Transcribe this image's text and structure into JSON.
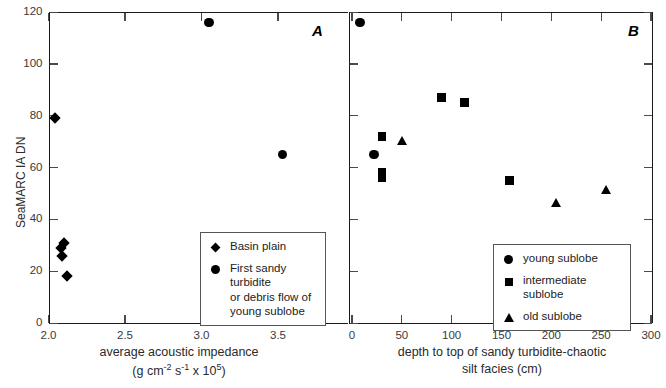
{
  "figure": {
    "y_axis_label": "SeaMARC IA DN",
    "panel_a_label": "A",
    "panel_b_label": "B"
  },
  "panel_a": {
    "xlabel_line1": "average acoustic impedance",
    "xlabel_line2_pre": "(g cm",
    "xlabel_line2_sup1": "-2",
    "xlabel_line2_mid": " s",
    "xlabel_line2_sup2": "-1",
    "xlabel_line2_post": " x 10",
    "xlabel_line2_sup3": "5",
    "xlabel_line2_end": ")",
    "x_ticks": [
      "2.0",
      "2.5",
      "3.0",
      "3.5"
    ],
    "y_ticks": [
      "0",
      "20",
      "40",
      "60",
      "80",
      "100",
      "120"
    ],
    "legend": [
      {
        "marker": "diamond",
        "label": "Basin plain"
      },
      {
        "marker": "circle",
        "label": "First sandy turbidite\nor debris flow of\nyoung sublobe"
      }
    ]
  },
  "panel_b": {
    "xlabel_line1": "depth to top of sandy turbidite-chaotic",
    "xlabel_line2": "silt facies (cm)",
    "x_ticks": [
      "0",
      "50",
      "100",
      "150",
      "200",
      "250",
      "300"
    ],
    "legend": [
      {
        "marker": "circle",
        "label": "young sublobe"
      },
      {
        "marker": "square",
        "label": "intermediate sublobe"
      },
      {
        "marker": "triangle",
        "label": "old sublobe"
      }
    ]
  },
  "chart_data": [
    {
      "type": "scatter",
      "panel": "A",
      "title": "",
      "xlabel": "average acoustic impedance (g cm-2 s-1 x 10^5)",
      "ylabel": "SeaMARC IA DN",
      "xlim": [
        1.95,
        3.75
      ],
      "ylim": [
        0,
        120
      ],
      "xticks": [
        2.0,
        2.5,
        3.0,
        3.5
      ],
      "yticks": [
        0,
        20,
        40,
        60,
        80,
        100,
        120
      ],
      "grid": false,
      "legend_position": "lower-right-inside",
      "series": [
        {
          "name": "Basin plain",
          "marker": "diamond",
          "color": "#000000",
          "points": [
            {
              "x": 2.04,
              "y": 79
            },
            {
              "x": 2.1,
              "y": 31
            },
            {
              "x": 2.08,
              "y": 29
            },
            {
              "x": 2.09,
              "y": 26
            },
            {
              "x": 2.12,
              "y": 18
            }
          ]
        },
        {
          "name": "First sandy turbidite or debris flow of young sublobe",
          "marker": "circle",
          "color": "#000000",
          "points": [
            {
              "x": 3.05,
              "y": 116
            },
            {
              "x": 3.53,
              "y": 65
            }
          ]
        }
      ]
    },
    {
      "type": "scatter",
      "panel": "B",
      "title": "",
      "xlabel": "depth to top of sandy turbidite-chaotic silt facies (cm)",
      "ylabel": "SeaMARC IA DN",
      "xlim": [
        0,
        300
      ],
      "ylim": [
        0,
        120
      ],
      "xticks": [
        0,
        50,
        100,
        150,
        200,
        250,
        300
      ],
      "yticks": [
        0,
        20,
        40,
        60,
        80,
        100,
        120
      ],
      "grid": false,
      "legend_position": "lower-right-inside",
      "series": [
        {
          "name": "young sublobe",
          "marker": "circle",
          "color": "#000000",
          "points": [
            {
              "x": 8,
              "y": 116
            },
            {
              "x": 22,
              "y": 65
            }
          ]
        },
        {
          "name": "intermediate sublobe",
          "marker": "square",
          "color": "#000000",
          "points": [
            {
              "x": 30,
              "y": 72
            },
            {
              "x": 30,
              "y": 58
            },
            {
              "x": 30,
              "y": 56
            },
            {
              "x": 90,
              "y": 87
            },
            {
              "x": 113,
              "y": 85
            },
            {
              "x": 158,
              "y": 55
            }
          ]
        },
        {
          "name": "old sublobe",
          "marker": "triangle",
          "color": "#000000",
          "points": [
            {
              "x": 50,
              "y": 70
            },
            {
              "x": 205,
              "y": 46
            },
            {
              "x": 255,
              "y": 51
            }
          ]
        }
      ]
    }
  ]
}
